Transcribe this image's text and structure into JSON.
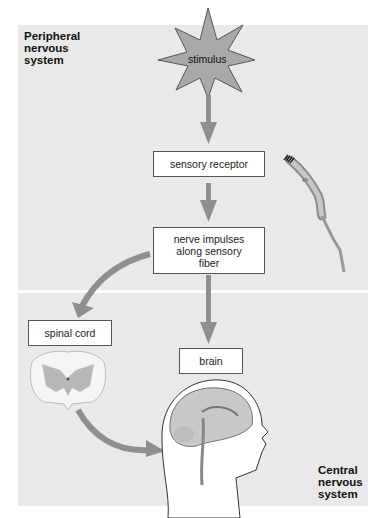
{
  "regions": {
    "peripheral": {
      "label_lines": [
        "Peripheral",
        "nervous",
        "system"
      ]
    },
    "central": {
      "label_lines": [
        "Central",
        "nervous",
        "system"
      ]
    }
  },
  "nodes": {
    "stimulus": "stimulus",
    "sensory_receptor": "sensory receptor",
    "nerve_impulses": [
      "nerve impulses",
      "along sensory",
      "fiber"
    ],
    "spinal_cord": "spinal cord",
    "brain": "brain"
  },
  "illustrations": [
    "sensory-neuron",
    "spinal-cord-cross-section",
    "head-brain-sagittal"
  ],
  "flow": [
    [
      "stimulus",
      "sensory receptor"
    ],
    [
      "sensory receptor",
      "nerve impulses along sensory fiber"
    ],
    [
      "nerve impulses along sensory fiber",
      "spinal cord"
    ],
    [
      "nerve impulses along sensory fiber",
      "brain"
    ],
    [
      "spinal cord",
      "brain"
    ]
  ],
  "colors": {
    "panel": "#e9e9e9",
    "arrow": "#8f8f8f",
    "star_fill": "#a9a9a9",
    "box_border": "#555555"
  }
}
